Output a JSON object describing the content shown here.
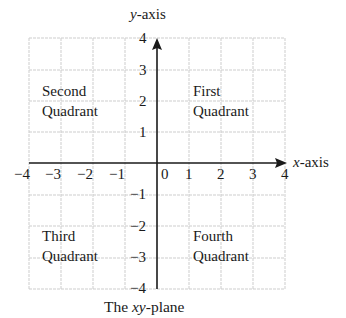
{
  "diagram": {
    "title_prefix": "The ",
    "title_var": "xy",
    "title_suffix": "-plane",
    "y_axis_var": "y",
    "y_axis_suffix": "-axis",
    "x_axis_var": "x",
    "x_axis_suffix": "-axis",
    "x_ticks": [
      "−4",
      "−3",
      "−2",
      "−1",
      "0",
      "1",
      "2",
      "3",
      "4"
    ],
    "y_ticks": [
      "4",
      "3",
      "2",
      "1",
      "−1",
      "−2",
      "−3",
      "−4"
    ],
    "quadrants": {
      "second": {
        "line1": "Second",
        "line2": "Quadrant"
      },
      "first": {
        "line1": "First",
        "line2": "Quadrant"
      },
      "third": {
        "line1": "Third",
        "line2": "Quadrant"
      },
      "fourth": {
        "line1": "Fourth",
        "line2": "Quadrant"
      }
    },
    "colors": {
      "grid": "#cfcfcf",
      "axis": "#1a1a1a",
      "text": "#1a1a1a"
    }
  }
}
